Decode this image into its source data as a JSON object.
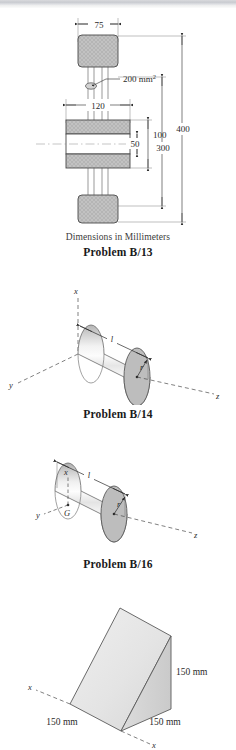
{
  "page": {
    "background_color": "#ffffff",
    "ink_color": "#2a2a2a",
    "fill_gray": "#b9b9b9",
    "band_color": "#c9cbd0"
  },
  "figures": [
    {
      "id": "problem-b-13",
      "type": "engineering-dimensioned-elevation",
      "caption_sub": "Dimensions in Millimeters",
      "caption_problem": "Problem B/13",
      "dimensions": [
        {
          "name": "top-block-width",
          "label": "75",
          "unit": "mm"
        },
        {
          "name": "cross-section-area",
          "label": "200 mm",
          "superscript": "2"
        },
        {
          "name": "middle-block-width",
          "label": "120",
          "unit": "mm"
        },
        {
          "name": "middle-block-height",
          "label": "100",
          "unit": "mm"
        },
        {
          "name": "inner-gap",
          "label": "50",
          "unit": "mm"
        },
        {
          "name": "span-300",
          "label": "300",
          "unit": "mm"
        },
        {
          "name": "overall-height",
          "label": "400",
          "unit": "mm"
        }
      ]
    },
    {
      "id": "problem-b-14",
      "type": "cylinder-isometric",
      "caption_problem": "Problem B/14",
      "axes": [
        "x",
        "y",
        "z"
      ],
      "labels": [
        {
          "name": "length",
          "label": "l"
        },
        {
          "name": "radius",
          "label": "r"
        }
      ]
    },
    {
      "id": "problem-b-16",
      "type": "cylinder-isometric-centroid",
      "caption_problem": "Problem B/16",
      "axes": [
        "x",
        "y",
        "z"
      ],
      "labels": [
        {
          "name": "length",
          "label": "l"
        },
        {
          "name": "radius",
          "label": "r"
        },
        {
          "name": "centroid",
          "label": "G"
        }
      ]
    },
    {
      "id": "wedge-figure",
      "type": "triangular-wedge-isometric",
      "axes": [
        "x",
        "x"
      ],
      "labels": [
        {
          "name": "height",
          "label": "150 mm"
        },
        {
          "name": "depth-left",
          "label": "150 mm"
        },
        {
          "name": "depth-right",
          "label": "150 mm"
        }
      ]
    }
  ]
}
